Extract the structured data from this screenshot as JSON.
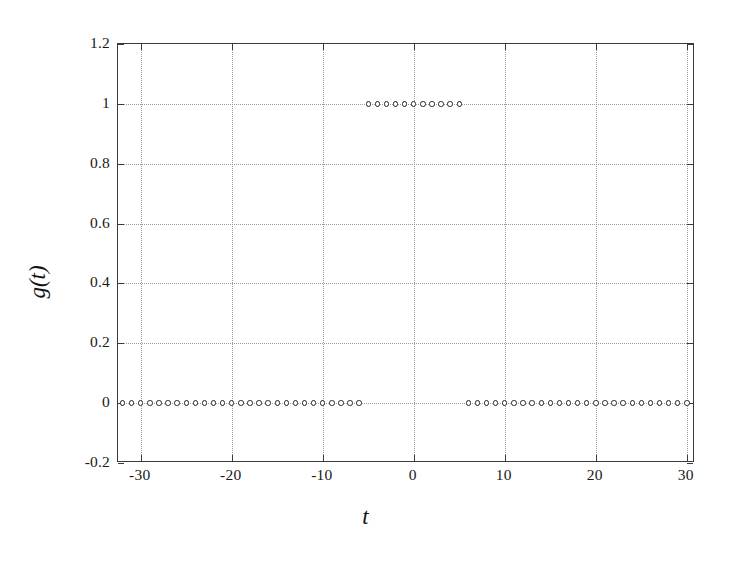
{
  "chart_data": {
    "type": "scatter",
    "title": "",
    "xlabel": "t",
    "ylabel": "g(t)",
    "xlim": [
      -32.5,
      30.9
    ],
    "ylim": [
      -0.2,
      1.2
    ],
    "xticks": [
      -30,
      -20,
      -10,
      0,
      10,
      20,
      30
    ],
    "xticklabels": [
      "-30",
      "-20",
      "-10",
      "0",
      "10",
      "20",
      "30"
    ],
    "yticks": [
      -0.2,
      0,
      0.2,
      0.4,
      0.6,
      0.8,
      1,
      1.2
    ],
    "yticklabels": [
      "-0.2",
      "0",
      "0.2",
      "0.4",
      "0.6",
      "0.8",
      "1",
      "1.2"
    ],
    "grid": true,
    "grid_style": "dotted",
    "legend": "none",
    "marker": "open-circle",
    "marker_color": "#262626",
    "series": [
      {
        "name": "g(t)",
        "x": [
          -32,
          -31,
          -30,
          -29,
          -28,
          -27,
          -26,
          -25,
          -24,
          -23,
          -22,
          -21,
          -20,
          -19,
          -18,
          -17,
          -16,
          -15,
          -14,
          -13,
          -12,
          -11,
          -10,
          -9,
          -8,
          -7,
          -6,
          -5,
          -4,
          -3,
          -2,
          -1,
          0,
          1,
          2,
          3,
          4,
          5,
          6,
          7,
          8,
          9,
          10,
          11,
          12,
          13,
          14,
          15,
          16,
          17,
          18,
          19,
          20,
          21,
          22,
          23,
          24,
          25,
          26,
          27,
          28,
          29,
          30,
          31
        ],
        "y": [
          0,
          0,
          0,
          0,
          0,
          0,
          0,
          0,
          0,
          0,
          0,
          0,
          0,
          0,
          0,
          0,
          0,
          0,
          0,
          0,
          0,
          0,
          0,
          0,
          0,
          0,
          0,
          1,
          1,
          1,
          1,
          1,
          1,
          1,
          1,
          1,
          1,
          1,
          0,
          0,
          0,
          0,
          0,
          0,
          0,
          0,
          0,
          0,
          0,
          0,
          0,
          0,
          0,
          0,
          0,
          0,
          0,
          0,
          0,
          0,
          0,
          0,
          0,
          0
        ]
      }
    ]
  }
}
